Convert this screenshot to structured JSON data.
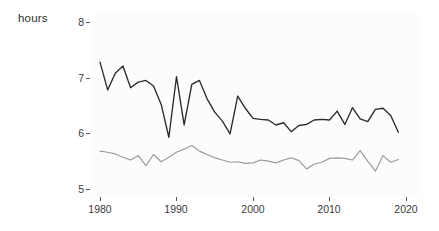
{
  "axis_title": "hours",
  "y_ticks": [
    "8",
    "7",
    "6",
    "5"
  ],
  "x_ticks": [
    "1980",
    "1990",
    "2000",
    "2010",
    "2020"
  ],
  "colors": {
    "series_dark": "#2b2b2b",
    "series_gray": "#9a9a9a",
    "panel_background": "#fcfcfc",
    "page_background": "#ffffff",
    "tick_text": "#3a3a3a"
  },
  "chart_data": {
    "type": "line",
    "title": "",
    "subtitle": "",
    "xlabel": "",
    "ylabel": "hours",
    "xlim": [
      1979,
      2021
    ],
    "ylim": [
      4.78,
      8.2
    ],
    "grid": false,
    "legend": "none",
    "y_tick_values": [
      5,
      6,
      7,
      8
    ],
    "x_tick_values": [
      1980,
      1990,
      2000,
      2010,
      2020
    ],
    "x": [
      1980,
      1981,
      1982,
      1983,
      1984,
      1985,
      1986,
      1987,
      1988,
      1989,
      1990,
      1991,
      1992,
      1993,
      1994,
      1995,
      1996,
      1997,
      1998,
      1999,
      2000,
      2001,
      2002,
      2003,
      2004,
      2005,
      2006,
      2007,
      2008,
      2009,
      2010,
      2011,
      2012,
      2013,
      2014,
      2015,
      2016,
      2017,
      2018,
      2019
    ],
    "series": [
      {
        "name": "upper-series",
        "color": "#2b2b2b",
        "values": [
          7.28,
          6.78,
          7.08,
          7.21,
          6.82,
          6.92,
          6.95,
          6.85,
          6.52,
          5.93,
          7.02,
          6.15,
          6.88,
          6.95,
          6.62,
          6.38,
          6.22,
          5.99,
          6.67,
          6.45,
          6.27,
          6.25,
          6.24,
          6.15,
          6.19,
          6.03,
          6.14,
          6.16,
          6.24,
          6.25,
          6.24,
          6.4,
          6.16,
          6.46,
          6.26,
          6.21,
          6.43,
          6.45,
          6.32,
          6.02
        ]
      },
      {
        "name": "lower-series",
        "color": "#9a9a9a",
        "values": [
          5.68,
          5.66,
          5.63,
          5.57,
          5.52,
          5.6,
          5.42,
          5.62,
          5.49,
          5.57,
          5.66,
          5.72,
          5.78,
          5.68,
          5.62,
          5.56,
          5.52,
          5.48,
          5.49,
          5.46,
          5.47,
          5.52,
          5.5,
          5.47,
          5.52,
          5.56,
          5.51,
          5.36,
          5.45,
          5.48,
          5.55,
          5.56,
          5.55,
          5.52,
          5.69,
          5.5,
          5.32,
          5.6,
          5.48,
          5.53
        ]
      }
    ]
  }
}
